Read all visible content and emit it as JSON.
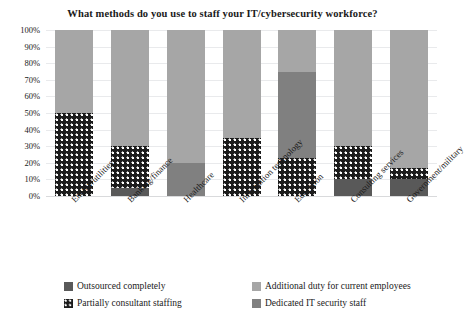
{
  "chart_data": {
    "type": "bar",
    "subtype": "100% stacked column",
    "title": "What methods do you use to staff your IT/cybersecurity workforce?",
    "xlabel": "",
    "ylabel": "",
    "ylim": [
      0,
      100
    ],
    "yticks": [
      "0%",
      "10%",
      "20%",
      "30%",
      "40%",
      "50%",
      "60%",
      "70%",
      "80%",
      "90%",
      "100%"
    ],
    "ytick_values": [
      0,
      10,
      20,
      30,
      40,
      50,
      60,
      70,
      80,
      90,
      100
    ],
    "grid": true,
    "legend_position": "bottom",
    "categories": [
      "Energy/utilities",
      "Banking/finance",
      "Healthcare",
      "Information technology",
      "Education",
      "Consulting services",
      "Government/military"
    ],
    "series": [
      {
        "name": "Outsourced completely",
        "key": "outsourced",
        "color": "#595959",
        "values": [
          0,
          5,
          0,
          0,
          0,
          10,
          10
        ]
      },
      {
        "name": "Partially consultant staffing",
        "key": "partial",
        "color": "#1c1c1c",
        "pattern": "dotted",
        "values": [
          50,
          25,
          0,
          35,
          23,
          20,
          7
        ]
      },
      {
        "name": "Dedicated IT security staff",
        "key": "dedicated",
        "color": "#808080",
        "values": [
          0,
          0,
          20,
          0,
          52,
          0,
          0
        ]
      },
      {
        "name": "Additional duty for current employees",
        "key": "additional",
        "color": "#a6a6a6",
        "values": [
          50,
          70,
          80,
          65,
          25,
          70,
          83
        ]
      }
    ],
    "legend_entries": [
      "Outsourced completely",
      "Partially consultant staffing",
      "Additional duty for current employees",
      "Dedicated IT security staff"
    ]
  },
  "colors": {
    "outsourced": "#595959",
    "partial": "#1c1c1c",
    "dedicated": "#808080",
    "additional": "#a6a6a6",
    "gridline": "#e9eaec",
    "background": "#ffffff",
    "text": "#1a1a1a"
  }
}
